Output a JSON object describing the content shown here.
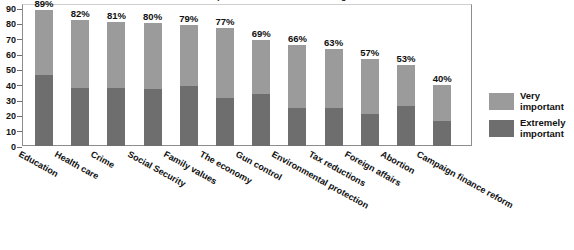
{
  "chart_data": {
    "type": "bar",
    "subtype": "stacked-bar",
    "title": "Importance of issues in deciding vote",
    "xlabel": "",
    "ylabel": "",
    "ylim": [
      0,
      90
    ],
    "yticks": [
      0,
      10,
      20,
      30,
      40,
      50,
      60,
      70,
      80,
      90
    ],
    "grid": false,
    "legend_position": "right",
    "categories": [
      "Education",
      "Health care",
      "Crime",
      "Social Security",
      "Family values",
      "The economy",
      "Gun control",
      "Environmental protection",
      "Tax reductions",
      "Foreign affairs",
      "Abortion",
      "Campaign finance reform"
    ],
    "series": [
      {
        "name": "Extremely important",
        "color": "#6e6e6e",
        "values": [
          46,
          38,
          38,
          37,
          39,
          31,
          34,
          25,
          25,
          21,
          26,
          16
        ]
      },
      {
        "name": "Very important",
        "color": "#9b9b9b",
        "values": [
          43,
          44,
          43,
          43,
          40,
          46,
          35,
          41,
          38,
          36,
          27,
          24
        ]
      }
    ],
    "totals": [
      89,
      82,
      81,
      80,
      79,
      77,
      69,
      66,
      63,
      57,
      53,
      40
    ],
    "data_labels": [
      "89%",
      "82%",
      "81%",
      "80%",
      "79%",
      "77%",
      "69%",
      "66%",
      "63%",
      "57%",
      "53%",
      "40%"
    ]
  },
  "legend": {
    "items": [
      {
        "label_line1": "Very",
        "label_line2": "important",
        "color": "#9b9b9b"
      },
      {
        "label_line1": "Extremely",
        "label_line2": "important",
        "color": "#6e6e6e"
      }
    ]
  }
}
